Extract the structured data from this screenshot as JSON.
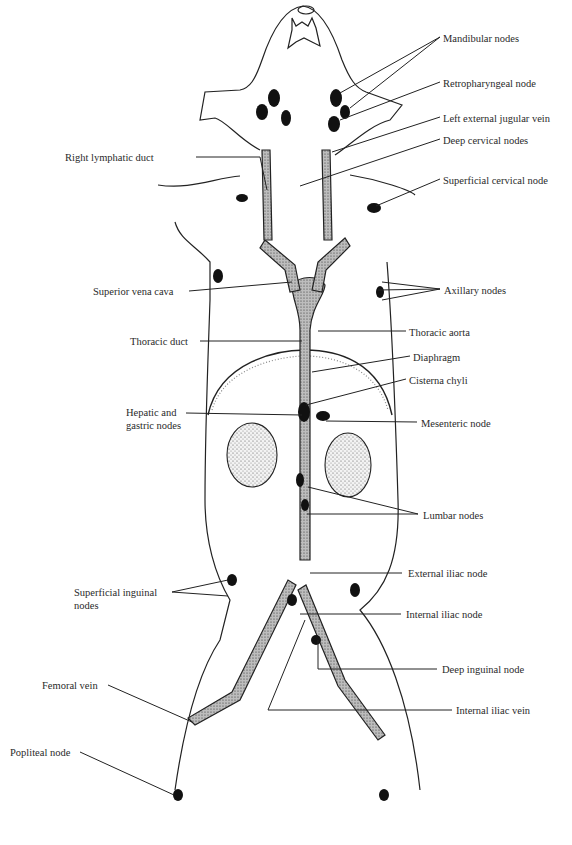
{
  "figure": {
    "labels_right": [
      {
        "id": "mandibular-nodes",
        "text": "Mandibular nodes",
        "x": 443,
        "y": 32
      },
      {
        "id": "retropharyngeal-node",
        "text": "Retropharyngeal node",
        "x": 443,
        "y": 77
      },
      {
        "id": "left-external-jugular-vein",
        "text": "Left external jugular vein",
        "x": 443,
        "y": 112
      },
      {
        "id": "deep-cervical-nodes",
        "text": "Deep cervical nodes",
        "x": 443,
        "y": 134
      },
      {
        "id": "superficial-cervical-node",
        "text": "Superficial cervical node",
        "x": 443,
        "y": 174
      },
      {
        "id": "axillary-nodes",
        "text": "Axillary nodes",
        "x": 444,
        "y": 284
      },
      {
        "id": "thoracic-aorta",
        "text": "Thoracic aorta",
        "x": 409,
        "y": 326
      },
      {
        "id": "diaphragm",
        "text": "Diaphragm",
        "x": 413,
        "y": 351
      },
      {
        "id": "cisterna-chyli",
        "text": "Cisterna chyli",
        "x": 409,
        "y": 374
      },
      {
        "id": "mesenteric-node",
        "text": "Mesenteric node",
        "x": 421,
        "y": 417
      },
      {
        "id": "lumbar-nodes",
        "text": "Lumbar nodes",
        "x": 423,
        "y": 509
      },
      {
        "id": "external-iliac-node",
        "text": "External iliac node",
        "x": 408,
        "y": 567
      },
      {
        "id": "internal-iliac-node",
        "text": "Internal iliac node",
        "x": 406,
        "y": 608
      },
      {
        "id": "deep-inguinal-node",
        "text": "Deep inguinal node",
        "x": 442,
        "y": 663
      },
      {
        "id": "internal-iliac-vein",
        "text": "Internal iliac vein",
        "x": 456,
        "y": 704
      }
    ],
    "labels_left": [
      {
        "id": "right-lymphatic-duct",
        "text": "Right lymphatic duct",
        "x": 65,
        "y": 152
      },
      {
        "id": "superior-vena-cava",
        "text": "Superior vena cava",
        "x": 93,
        "y": 286
      },
      {
        "id": "thoracic-duct",
        "text": "Thoracic duct",
        "x": 130,
        "y": 336
      },
      {
        "id": "hepatic-and-gastric-nodes",
        "text": "Hepatic and\ngastric nodes",
        "x": 126,
        "y": 406
      },
      {
        "id": "superficial-inguinal-nodes",
        "text": "Superficial inguinal\nnodes",
        "x": 74,
        "y": 587
      },
      {
        "id": "femoral-vein",
        "text": "Femoral vein",
        "x": 42,
        "y": 679
      },
      {
        "id": "popliteal-node",
        "text": "Popliteal node",
        "x": 10,
        "y": 746
      }
    ]
  }
}
